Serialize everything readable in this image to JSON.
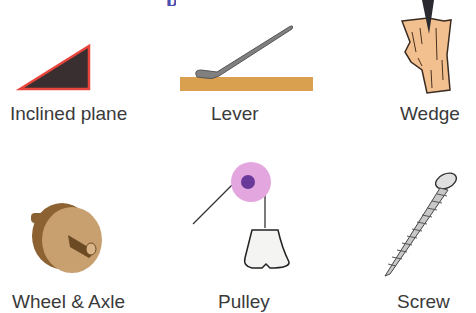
{
  "title_fragment": "p",
  "machines": [
    {
      "name": "Inclined plane"
    },
    {
      "name": "Lever"
    },
    {
      "name": "Wedge"
    },
    {
      "name": "Wheel & Axle"
    },
    {
      "name": "Pulley"
    },
    {
      "name": "Screw"
    }
  ],
  "colors": {
    "title": "#4a4fb0",
    "inclined_fill": "#3a2f30",
    "inclined_border": "#e8453c",
    "wood": "#d9a050",
    "wedge_wood": "#f2c08e",
    "lever_metal": "#707070",
    "pulley_wheel": "#e3a6de",
    "pulley_hub": "#6a3a9a",
    "wheel": "#b4864e",
    "screw": "#c8c8c8"
  }
}
